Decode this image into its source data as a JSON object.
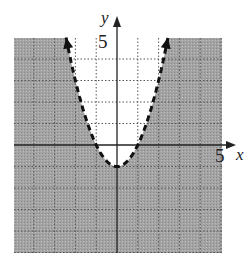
{
  "chart_data": {
    "type": "inequality-graph",
    "title": "",
    "inequality": "y < x^2 - 1",
    "boundary": {
      "equation": "y = x^2 - 1",
      "style": "dashed",
      "vertex": [
        0,
        -1
      ],
      "x_intercepts": [
        -1,
        1
      ]
    },
    "shaded_region": "outside/below the parabola",
    "xlabel": "x",
    "ylabel": "y",
    "xlim": [
      -5,
      5
    ],
    "ylim": [
      -5,
      5
    ],
    "tick_labels": {
      "x": "5",
      "y": "5"
    },
    "grid": true,
    "grid_step": 1,
    "colors": {
      "shade": "#9a9a9a",
      "grid": "#555555",
      "curve": "#111111",
      "axis": "#222222"
    }
  },
  "labels": {
    "x_axis": "x",
    "y_axis": "y",
    "x_tick": "5",
    "y_tick": "5"
  }
}
